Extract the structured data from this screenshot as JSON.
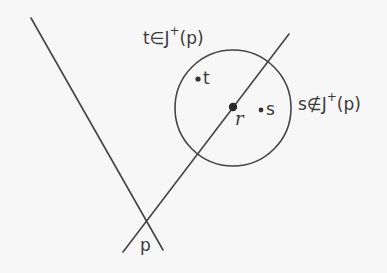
{
  "diagram": {
    "title": "",
    "colors": {
      "background": "#f7f7f7",
      "stroke": "#444444",
      "text": "#3a3a3a"
    },
    "lines": [
      {
        "id": "left-boundary",
        "x1": 31,
        "y1": 18,
        "x2": 163,
        "y2": 250
      },
      {
        "id": "right-boundary",
        "x1": 289,
        "y1": 34,
        "x2": 123,
        "y2": 252
      }
    ],
    "circle": {
      "cx": 233,
      "cy": 108,
      "r": 58
    },
    "points": [
      {
        "id": "t",
        "cx": 198,
        "cy": 79,
        "r": 2.6
      },
      {
        "id": "r",
        "cx": 233,
        "cy": 107,
        "r": 4.2
      },
      {
        "id": "s",
        "cx": 261,
        "cy": 110,
        "r": 2.4
      }
    ],
    "labels": {
      "t_in": {
        "prefix": "t∈J",
        "sup": "+",
        "suffix": "(p)"
      },
      "s_notin": {
        "prefix": "s∉J",
        "sup": "+",
        "suffix": "(p)"
      },
      "t": "t",
      "r": "r",
      "s": "s",
      "p": "p"
    }
  }
}
